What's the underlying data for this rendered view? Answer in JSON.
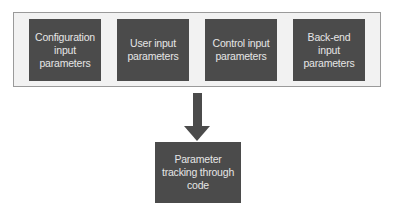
{
  "diagram": {
    "input_group": {
      "boxes": [
        {
          "label": "Configuration input parameters"
        },
        {
          "label": "User input parameters"
        },
        {
          "label": "Control input parameters"
        },
        {
          "label": "Back-end input parameters"
        }
      ]
    },
    "arrow": {
      "direction": "down",
      "icon": "down-arrow-icon"
    },
    "output_box": {
      "label": "Parameter tracking through code"
    },
    "colors": {
      "box_fill": "#4b4b4b",
      "box_text": "#e6e6e6",
      "container_fill": "#f2f2f2",
      "container_border": "#9a9a9a"
    }
  }
}
